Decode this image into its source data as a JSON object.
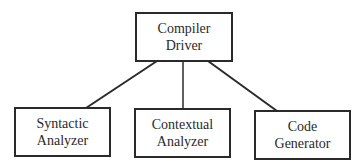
{
  "diagram": {
    "type": "hierarchy",
    "root": {
      "id": "driver",
      "lines": [
        "Compiler",
        "Driver"
      ]
    },
    "children": [
      {
        "id": "syntactic",
        "lines": [
          "Syntactic",
          "Analyzer"
        ]
      },
      {
        "id": "contextual",
        "lines": [
          "Contextual",
          "Analyzer"
        ]
      },
      {
        "id": "codegen",
        "lines": [
          "Code",
          "Generator"
        ]
      }
    ],
    "edges": [
      {
        "from": "driver",
        "to": "syntactic"
      },
      {
        "from": "driver",
        "to": "contextual"
      },
      {
        "from": "driver",
        "to": "codegen"
      }
    ],
    "colors": {
      "stroke": "#2a2a2a",
      "background": "#ffffff",
      "text": "#2a2a2a"
    }
  }
}
